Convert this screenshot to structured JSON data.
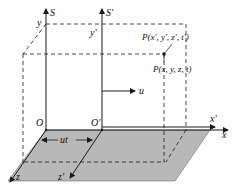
{
  "diagram": {
    "frames": {
      "S": {
        "label": "S",
        "origin": "O",
        "axes": {
          "x": "x",
          "y": "y",
          "z": "z"
        }
      },
      "S_prime": {
        "label": "S'",
        "origin": "O'",
        "axes": {
          "x": "x'",
          "y": "y'",
          "z": "z'"
        }
      }
    },
    "velocity_label": "u",
    "displacement_label": "ut",
    "point_S_prime_label": "P(x', y', z', t')",
    "point_S_label": "P(x, y, z, t)",
    "colors": {
      "plane_fill": "#b8b8b8",
      "line": "#1a1a1a",
      "background": "#ffffff"
    }
  }
}
